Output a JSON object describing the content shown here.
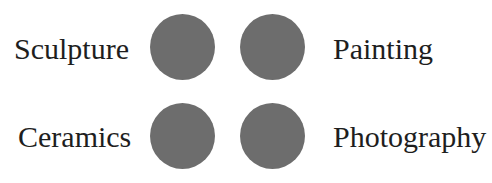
{
  "items": [
    {
      "label": "Sculpture"
    },
    {
      "label": "Painting"
    },
    {
      "label": "Ceramics"
    },
    {
      "label": "Photography"
    }
  ],
  "colors": {
    "circle": "#6d6d6d",
    "text": "#1e1e1e"
  }
}
